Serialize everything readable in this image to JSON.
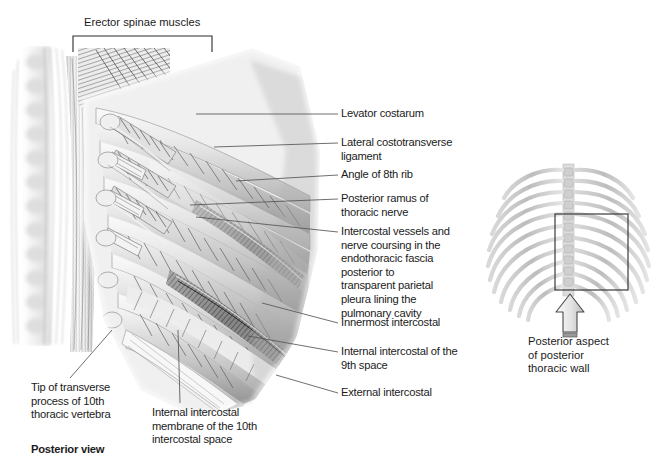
{
  "figure": {
    "view_caption": "Posterior view",
    "bracket_label": "Erector spinae muscles"
  },
  "labels": [
    {
      "id": "levator-costarum",
      "text": "Levator costarum"
    },
    {
      "id": "lateral-costotransverse-ligament",
      "text": "Lateral costotransverse\nligament"
    },
    {
      "id": "angle-of-8th-rib",
      "text": "Angle of 8th rib"
    },
    {
      "id": "posterior-ramus-of-thoracic-nerve",
      "text": "Posterior ramus of\nthoracic nerve"
    },
    {
      "id": "intercostal-vessels-and-nerve",
      "text": "Intercostal vessels and\nnerve coursing in the\nendothoracic fascia\nposterior to\ntransparent parietal\npleura lining the\npulmonary cavity"
    },
    {
      "id": "innermost-intercostal",
      "text": "Innermost intercostal"
    },
    {
      "id": "internal-intercostal-9th-space",
      "text": "Internal intercostal of the\n9th space"
    },
    {
      "id": "external-intercostal",
      "text": "External intercostal"
    },
    {
      "id": "tip-of-transverse-process",
      "text": "Tip of transverse\nprocess of 10th\nthoracic vertebra"
    },
    {
      "id": "internal-intercostal-membrane",
      "text": "Internal intercostal\nmembrane of the 10th\nintercostal space"
    }
  ],
  "inset": {
    "caption": "Posterior aspect\nof posterior\nthoracic wall",
    "region_box_name": "region-of-interest-box",
    "arrow_name": "view-direction-arrow"
  },
  "colors": {
    "ink": "#1b1b1b",
    "leader": "#4a4a4a",
    "bone_light": "#d8d8d8",
    "bone_mid": "#a9a9a9",
    "muscle_dark": "#2e2e2e",
    "muscle_mid": "#8c8c8c",
    "paper": "#ffffff"
  }
}
